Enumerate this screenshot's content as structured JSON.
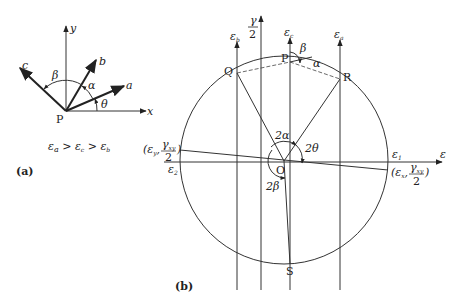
{
  "panel_a": {
    "label": "(a)",
    "axes": {
      "x": "x",
      "y": "y"
    },
    "origin": "P",
    "rays": {
      "a": "a",
      "b": "b",
      "c": "c"
    },
    "angles": {
      "theta": "θ",
      "alpha": "α",
      "beta": "β"
    },
    "condition": "εa > εc > εb",
    "condition_parts": {
      "ea": "ε",
      "a": "a",
      "gt1": " > ",
      "ec": "ε",
      "c": "c",
      "gt2": " > ",
      "eb": "ε",
      "b": "b"
    }
  },
  "panel_b": {
    "label": "(b)",
    "vertical_axis": {
      "gamma": "γ",
      "two": "2"
    },
    "horizontal_axis": "ε",
    "vertical_lines": {
      "eb": "ε",
      "eb_sub": "b",
      "ec": "ε",
      "ec_sub": "c",
      "ea": "ε",
      "ea_sub": "a"
    },
    "points": {
      "P": "P",
      "Q": "Q",
      "R": "R",
      "S": "S",
      "O": "O"
    },
    "angles": {
      "two_alpha": "2α",
      "two_theta": "2θ",
      "two_beta": "2β",
      "beta": "β",
      "alpha": "α"
    },
    "principal": {
      "e1": "ε",
      "e1_sub": "1",
      "e2": "ε",
      "e2_sub": "2"
    },
    "point_y": {
      "open": "(ε",
      "sub": "y",
      "comma": ",",
      "num": "γ",
      "num_sub": "xy",
      "close": ")",
      "den": "2"
    },
    "point_x": {
      "open": "(ε",
      "sub": "x",
      "comma": ",",
      "num": "γ",
      "num_sub": "xy",
      "close": ")",
      "den": "2"
    }
  }
}
